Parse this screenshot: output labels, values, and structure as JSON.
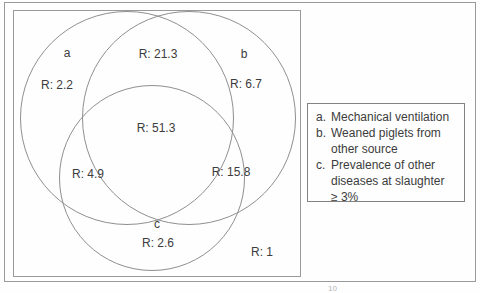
{
  "figure": {
    "type": "venn-diagram",
    "background_color": "#fefefe",
    "line_color": "#8f8f8f",
    "text_color": "#3c3c3c"
  },
  "venn": {
    "circles": [
      {
        "id": "a",
        "letter": "a"
      },
      {
        "id": "b",
        "letter": "b"
      },
      {
        "id": "c",
        "letter": "c"
      }
    ],
    "regions": [
      {
        "region": "a-only",
        "value": "R: 2.2"
      },
      {
        "region": "a-and-b",
        "value": "R: 21.3"
      },
      {
        "region": "b-only",
        "value": "R: 6.7"
      },
      {
        "region": "a-b-c",
        "value": "R: 51.3"
      },
      {
        "region": "a-and-c",
        "value": "R: 4.9"
      },
      {
        "region": "b-and-c",
        "value": "R: 15.8"
      },
      {
        "region": "c-only",
        "value": "R: 2.6"
      },
      {
        "region": "outside",
        "value": "R: 1"
      }
    ]
  },
  "legend": {
    "items": [
      {
        "marker": "a.",
        "text": "Mechanical ventilation"
      },
      {
        "marker": "b.",
        "text": "Weaned piglets from\nother source"
      },
      {
        "marker": "c.",
        "text": "Prevalence of other\ndiseases at slaughter\n≥ 3%"
      }
    ]
  },
  "footnote_fragment": "10"
}
